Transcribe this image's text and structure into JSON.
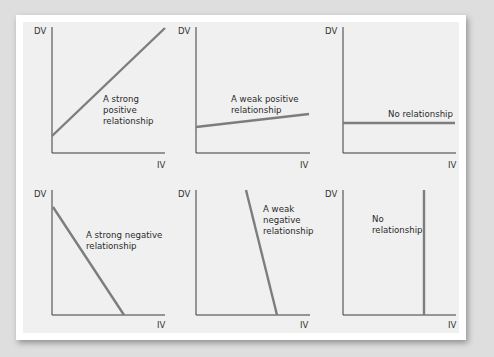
{
  "figure": {
    "axis_labels": {
      "y": "DV",
      "x": "IV"
    },
    "panels": [
      {
        "id": "strong-positive",
        "label_lines": [
          "A strong",
          "positive",
          "relationship"
        ]
      },
      {
        "id": "weak-positive",
        "label_lines": [
          "A weak positive",
          "relationship"
        ]
      },
      {
        "id": "no-relationship-horizontal",
        "label_lines": [
          "No relationship"
        ]
      },
      {
        "id": "strong-negative",
        "label_lines": [
          "A strong negative",
          "relationship"
        ]
      },
      {
        "id": "weak-negative",
        "label_lines": [
          "A weak",
          "negative",
          "relationship"
        ]
      },
      {
        "id": "no-relationship-vertical",
        "label_lines": [
          "No",
          "relationship"
        ]
      }
    ],
    "colors": {
      "axis": "#3a3a3a",
      "trend_line": "#7a7a7a",
      "panel_bg": "#f0f0f0",
      "frame": "#ffffff",
      "page_bg": "#dedede"
    }
  }
}
